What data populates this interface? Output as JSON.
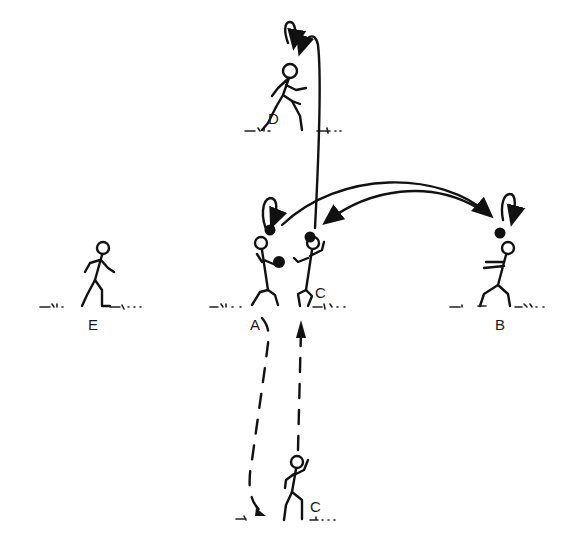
{
  "diagram": {
    "type": "sports-drill-illustration",
    "players": [
      {
        "id": "A",
        "label": "A",
        "role": "player holding two balls"
      },
      {
        "id": "B",
        "label": "B",
        "role": "receiver catching ball"
      },
      {
        "id": "C",
        "label": "C",
        "role": "player next to A receiving ball"
      },
      {
        "id": "C2",
        "label": "C",
        "role": "player running forward (start position)"
      },
      {
        "id": "D",
        "label": "D",
        "role": "player at far end"
      },
      {
        "id": "E",
        "label": "E",
        "role": "waiting player"
      }
    ],
    "movements": [
      {
        "from": "A",
        "to": "B",
        "kind": "ball-pass",
        "style": "solid-arrow"
      },
      {
        "from": "B",
        "to": "C",
        "kind": "ball-pass",
        "style": "solid-arrow"
      },
      {
        "from": "C",
        "to": "D",
        "kind": "ball-pass",
        "style": "solid-arrow"
      },
      {
        "from": "C2",
        "to": "C",
        "kind": "player-run",
        "style": "dashed-arrow"
      },
      {
        "from": "A",
        "to": "C2",
        "kind": "player-run",
        "style": "dashed-arrow"
      }
    ],
    "colors": {
      "ink": "#111111",
      "background": "#ffffff"
    }
  }
}
